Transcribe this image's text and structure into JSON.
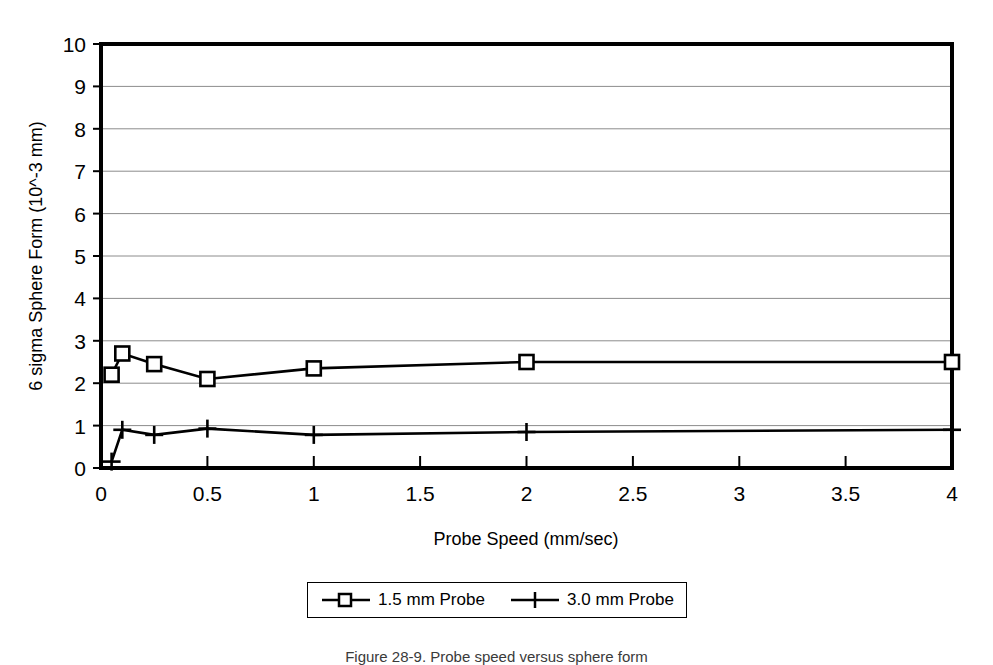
{
  "chart_data": {
    "type": "line",
    "title": "",
    "xlabel": "Probe Speed (mm/sec)",
    "ylabel": "6 sigma Sphere Form (10^-3 mm)",
    "xlim": [
      0,
      4
    ],
    "ylim": [
      0,
      10
    ],
    "xticks": [
      0,
      0.5,
      1,
      1.5,
      2,
      2.5,
      3,
      3.5,
      4
    ],
    "xtick_labels": [
      "0",
      "0.5",
      "1",
      "1.5",
      "2",
      "2.5",
      "3",
      "3.5",
      "4"
    ],
    "yticks": [
      0,
      1,
      2,
      3,
      4,
      5,
      6,
      7,
      8,
      9,
      10
    ],
    "ytick_labels": [
      "0",
      "1",
      "2",
      "3",
      "4",
      "5",
      "6",
      "7",
      "8",
      "9",
      "10"
    ],
    "grid": "horizontal",
    "legend_position": "below-plot",
    "series": [
      {
        "name": "1.5 mm Probe",
        "marker": "square",
        "x": [
          0.05,
          0.1,
          0.25,
          0.5,
          1,
          2,
          4
        ],
        "values": [
          2.2,
          2.7,
          2.45,
          2.1,
          2.35,
          2.5,
          2.5
        ]
      },
      {
        "name": "3.0 mm Probe",
        "marker": "plus",
        "x": [
          0.05,
          0.1,
          0.25,
          0.5,
          1,
          2,
          4
        ],
        "values": [
          0.15,
          0.9,
          0.78,
          0.93,
          0.78,
          0.85,
          0.9
        ]
      }
    ]
  },
  "axis": {
    "x_title": "Probe Speed (mm/sec)",
    "y_title": "6 sigma Sphere Form (10^-3 mm)"
  },
  "legend": {
    "entries": [
      {
        "label": "1.5 mm Probe"
      },
      {
        "label": "3.0 mm Probe"
      }
    ]
  },
  "caption": {
    "text": "Figure 28-9. Probe speed versus sphere form"
  },
  "colors": {
    "line": "#000000",
    "grid": "#808080",
    "axis": "#000000",
    "background": "#ffffff"
  }
}
